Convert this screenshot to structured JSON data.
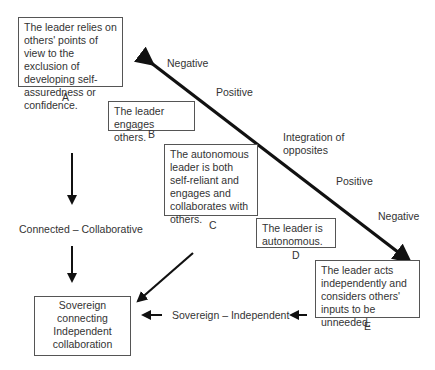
{
  "boxes": {
    "A": {
      "text": "The leader relies on others' points of view to the exclusion of developing self-assuredness or confidence.",
      "letter": "A"
    },
    "B": {
      "text": "The leader engages others.",
      "letter": "B"
    },
    "C": {
      "text": "The autonomous leader is both self-reliant and engages and collaborates with others.",
      "letter": "C"
    },
    "D": {
      "text": "The leader is autonomous.",
      "letter": "D"
    },
    "E": {
      "text": "The leader acts independently and considers others' inputs to be unneeded.",
      "letter": "E"
    },
    "result": {
      "line1": "Sovereign",
      "line2": "connecting",
      "line3": "Independent",
      "line4": "collaboration"
    }
  },
  "axis_labels": {
    "negative_top": "Negative",
    "positive_top": "Positive",
    "integration": "Integration of opposites",
    "positive_bottom": "Positive",
    "negative_bottom": "Negative"
  },
  "flow_labels": {
    "connected": "Connected – Collaborative",
    "sovereign": "Sovereign – Independent"
  }
}
